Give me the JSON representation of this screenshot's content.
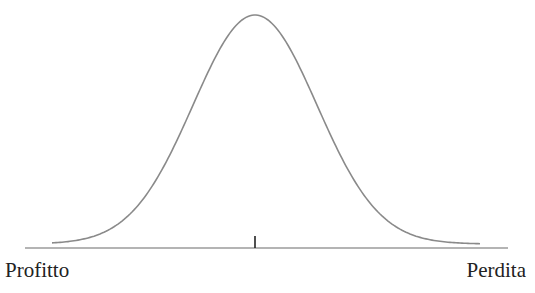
{
  "diagram": {
    "type": "normal-distribution-curve",
    "labels": {
      "left": "Profitto",
      "right": "Perdita"
    },
    "colors": {
      "curve": "#8a8a8a",
      "axis": "#6a6a6a",
      "tick": "#222222",
      "text": "#222222"
    }
  },
  "chart_data": {
    "type": "line",
    "title": "",
    "xlabel": "",
    "ylabel": "",
    "x_tick_labels": [
      "Profitto",
      "Perdita"
    ],
    "center_tick": true,
    "shape": "bell curve (normal distribution), centered",
    "grid": false
  }
}
